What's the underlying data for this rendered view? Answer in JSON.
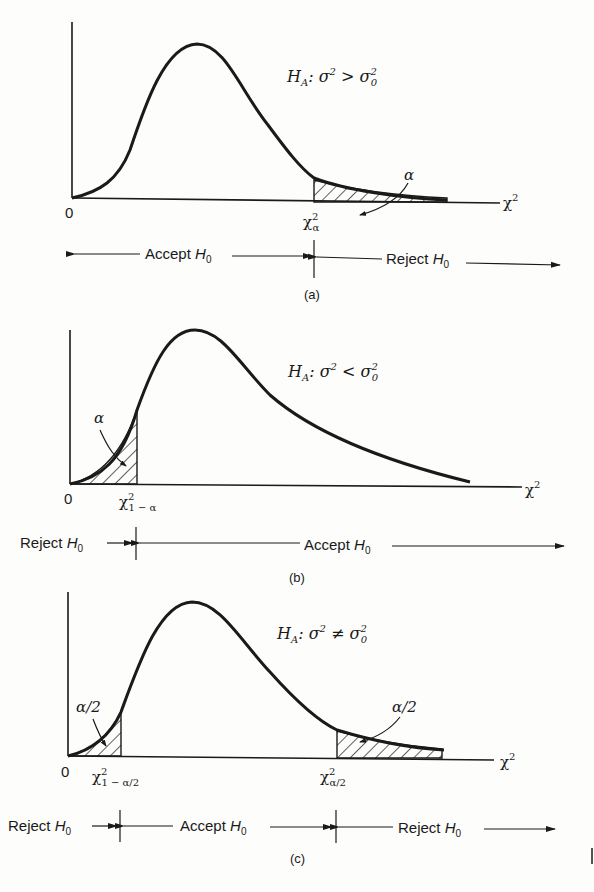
{
  "figure": {
    "panels": [
      {
        "id": "a",
        "caption": "(a)",
        "hypothesis": {
          "H": "H",
          "sub": "A",
          "rel": ": σ",
          "sup": "2",
          "op": " > σ",
          "sub0": "0",
          "sup0": "2"
        },
        "origin_label": "0",
        "axis_label": "χ",
        "axis_sup": "2",
        "critical_label": "χ",
        "critical_sup": "2",
        "critical_sub": "α",
        "area_labels": [
          "α"
        ],
        "regions": [
          {
            "label": "Accept ",
            "h": "H",
            "sub": "0"
          },
          {
            "label": "Reject ",
            "h": "H",
            "sub": "0"
          }
        ]
      },
      {
        "id": "b",
        "caption": "(b)",
        "hypothesis": {
          "H": "H",
          "sub": "A",
          "rel": ": σ",
          "sup": "2",
          "op": " < σ",
          "sub0": "0",
          "sup0": "2"
        },
        "origin_label": "0",
        "axis_label": "χ",
        "axis_sup": "2",
        "critical_label": "χ",
        "critical_sup": "2",
        "critical_sub": "1 − α",
        "area_labels": [
          "α"
        ],
        "regions": [
          {
            "label": "Reject ",
            "h": "H",
            "sub": "0"
          },
          {
            "label": "Accept ",
            "h": "H",
            "sub": "0"
          }
        ]
      },
      {
        "id": "c",
        "caption": "(c)",
        "hypothesis": {
          "H": "H",
          "sub": "A",
          "rel": ": σ",
          "sup": "2",
          "op": " ≠ σ",
          "sub0": "0",
          "sup0": "2"
        },
        "origin_label": "0",
        "axis_label": "χ",
        "axis_sup": "2",
        "critical_left_label": "χ",
        "critical_left_sup": "2",
        "critical_left_sub": "1 − α/2",
        "critical_right_label": "χ",
        "critical_right_sup": "2",
        "critical_right_sub": "α/2",
        "area_labels": [
          "α/2",
          "α/2"
        ],
        "regions": [
          {
            "label": "Reject ",
            "h": "H",
            "sub": "0"
          },
          {
            "label": "Accept ",
            "h": "H",
            "sub": "0"
          },
          {
            "label": "Reject ",
            "h": "H",
            "sub": "0"
          }
        ]
      }
    ]
  }
}
